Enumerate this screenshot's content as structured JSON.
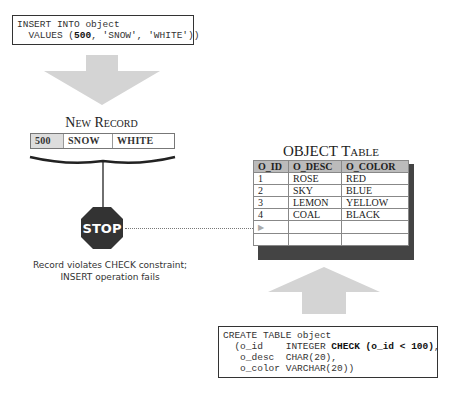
{
  "insert_statement": {
    "line1": "INSERT INTO object",
    "line2_prefix": "  VALUES (",
    "line2_bold": "500",
    "line2_suffix": ", 'SNOW', 'WHITE'))"
  },
  "new_record": {
    "title": "New Record",
    "values": [
      "500",
      "SNOW",
      "WHITE"
    ]
  },
  "stop_sign": {
    "label": "STOP",
    "color": "#333333"
  },
  "caption": {
    "line1": "Record violates CHECK constraint;",
    "line2": "INSERT operation fails"
  },
  "object_table": {
    "title": "OBJECT Table",
    "headers": [
      "O_ID",
      "O_DESC",
      "O_COLOR"
    ],
    "rows": [
      [
        "1",
        "ROSE",
        "RED"
      ],
      [
        "2",
        "SKY",
        "BLUE"
      ],
      [
        "3",
        "LEMON",
        "YELLOW"
      ],
      [
        "4",
        "COAL",
        "BLACK"
      ],
      [
        "",
        "",
        ""
      ],
      [
        "",
        "",
        ""
      ]
    ]
  },
  "create_statement": {
    "line1": "CREATE TABLE object",
    "line2_prefix": "  (o_id    INTEGER ",
    "line2_bold": "CHECK (o_id < 100)",
    "line2_suffix": ",",
    "line3": "   o_desc  CHAR(20),",
    "line4": "   o_color VARCHAR(20))"
  },
  "arrow_color": "#d4d4d4"
}
